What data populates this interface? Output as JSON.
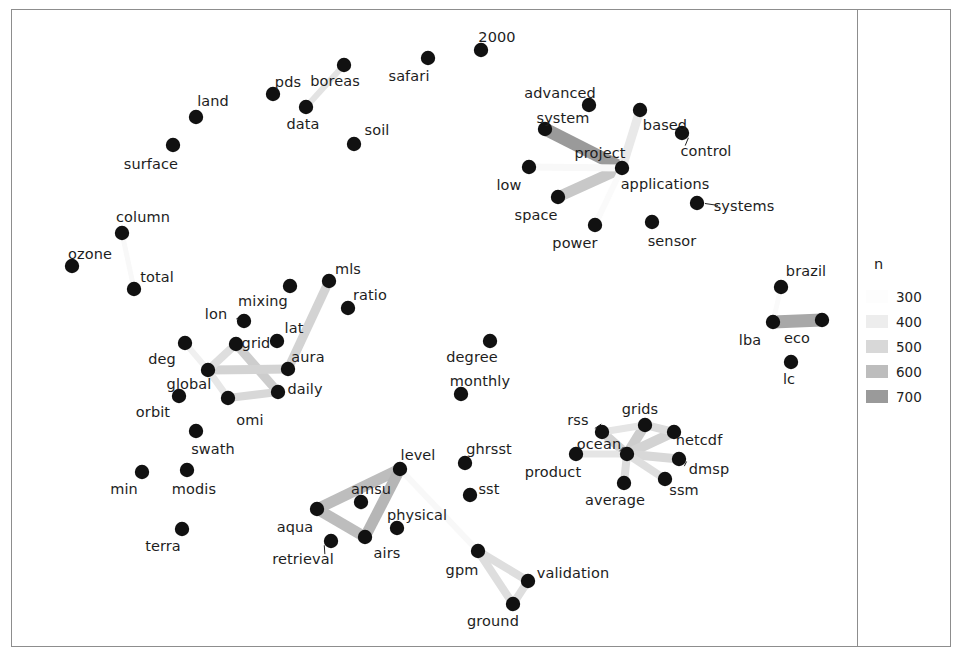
{
  "figure": {
    "title": "",
    "background": "#ffffff",
    "frame_color": "#8d8d8d",
    "node_color": "#111111",
    "label_color": "#1d1d1d"
  },
  "legend": {
    "title": "n",
    "position": "right",
    "entries": [
      {
        "value": "300",
        "color": "#fdfdfd"
      },
      {
        "value": "400",
        "color": "#ededed"
      },
      {
        "value": "500",
        "color": "#d8d8d8"
      },
      {
        "value": "600",
        "color": "#bdbdbd"
      },
      {
        "value": "700",
        "color": "#9a9a9a"
      }
    ]
  },
  "chart_data": {
    "type": "scatter",
    "subtype": "network-graph",
    "title": "",
    "xlabel": "",
    "ylabel": "",
    "grid": false,
    "legend_position": "right",
    "legend_title": "n",
    "legend_values": [
      300,
      400,
      500,
      600,
      700
    ],
    "edge_weight_range": [
      300,
      700
    ],
    "node_count": 56,
    "edge_count": 22,
    "nodes": [
      {
        "id": "2000",
        "label": "2000",
        "x": 481,
        "y": 50,
        "label_x": 497,
        "label_y": 37
      },
      {
        "id": "safari",
        "label": "safari",
        "x": 428,
        "y": 58,
        "label_x": 409,
        "label_y": 76
      },
      {
        "id": "pds",
        "label": "pds",
        "x": 273,
        "y": 94,
        "label_x": 288,
        "label_y": 82
      },
      {
        "id": "boreas",
        "label": "boreas",
        "x": 344,
        "y": 65,
        "label_x": 335,
        "label_y": 81
      },
      {
        "id": "data",
        "label": "data",
        "x": 306,
        "y": 107,
        "label_x": 303,
        "label_y": 124
      },
      {
        "id": "soil",
        "label": "soil",
        "x": 354,
        "y": 144,
        "label_x": 377,
        "label_y": 130
      },
      {
        "id": "land",
        "label": "land",
        "x": 196,
        "y": 117,
        "label_x": 213,
        "label_y": 101
      },
      {
        "id": "surface",
        "label": "surface",
        "x": 173,
        "y": 145,
        "label_x": 151,
        "label_y": 164
      },
      {
        "id": "advanced",
        "label": "advanced",
        "x": 589,
        "y": 105,
        "label_x": 560,
        "label_y": 93
      },
      {
        "id": "system",
        "label": "system",
        "x": 545,
        "y": 129,
        "label_x": 563,
        "label_y": 118
      },
      {
        "id": "based",
        "label": "based",
        "x": 640,
        "y": 110,
        "label_x": 665,
        "label_y": 125
      },
      {
        "id": "control",
        "label": "control",
        "x": 682,
        "y": 133,
        "label_x": 706,
        "label_y": 151
      },
      {
        "id": "project",
        "label": "project",
        "x": 622,
        "y": 168,
        "label_x": 600,
        "label_y": 153
      },
      {
        "id": "applications",
        "label": "applications",
        "x": 622,
        "y": 168,
        "label_x": 665,
        "label_y": 184
      },
      {
        "id": "low",
        "label": "low",
        "x": 529,
        "y": 167,
        "label_x": 509,
        "label_y": 185
      },
      {
        "id": "space",
        "label": "space",
        "x": 558,
        "y": 197,
        "label_x": 536,
        "label_y": 215
      },
      {
        "id": "systems",
        "label": "systems",
        "x": 697,
        "y": 203,
        "label_x": 744,
        "label_y": 206
      },
      {
        "id": "power",
        "label": "power",
        "x": 595,
        "y": 225,
        "label_x": 575,
        "label_y": 243
      },
      {
        "id": "sensor",
        "label": "sensor",
        "x": 652,
        "y": 222,
        "label_x": 672,
        "label_y": 241
      },
      {
        "id": "column",
        "label": "column",
        "x": 122,
        "y": 233,
        "label_x": 143,
        "label_y": 217
      },
      {
        "id": "ozone",
        "label": "ozone",
        "x": 72,
        "y": 266,
        "label_x": 90,
        "label_y": 254
      },
      {
        "id": "total",
        "label": "total",
        "x": 134,
        "y": 289,
        "label_x": 157,
        "label_y": 277
      },
      {
        "id": "mls",
        "label": "mls",
        "x": 329,
        "y": 281,
        "label_x": 348,
        "label_y": 269
      },
      {
        "id": "ratio",
        "label": "ratio",
        "x": 348,
        "y": 308,
        "label_x": 370,
        "label_y": 295
      },
      {
        "id": "mixing",
        "label": "mixing",
        "x": 290,
        "y": 286,
        "label_x": 263,
        "label_y": 301
      },
      {
        "id": "lon",
        "label": "lon",
        "x": 244,
        "y": 321,
        "label_x": 216,
        "label_y": 314
      },
      {
        "id": "grid",
        "label": "grid",
        "x": 236,
        "y": 344,
        "label_x": 256,
        "label_y": 343
      },
      {
        "id": "lat",
        "label": "lat",
        "x": 277,
        "y": 341,
        "label_x": 294,
        "label_y": 328
      },
      {
        "id": "deg",
        "label": "deg",
        "x": 185,
        "y": 343,
        "label_x": 162,
        "label_y": 359
      },
      {
        "id": "aura",
        "label": "aura",
        "x": 288,
        "y": 369,
        "label_x": 308,
        "label_y": 357
      },
      {
        "id": "global",
        "label": "global",
        "x": 208,
        "y": 370,
        "label_x": 189,
        "label_y": 384
      },
      {
        "id": "daily",
        "label": "daily",
        "x": 278,
        "y": 392,
        "label_x": 305,
        "label_y": 389
      },
      {
        "id": "orbit",
        "label": "orbit",
        "x": 179,
        "y": 396,
        "label_x": 153,
        "label_y": 412
      },
      {
        "id": "omi",
        "label": "omi",
        "x": 228,
        "y": 398,
        "label_x": 250,
        "label_y": 420
      },
      {
        "id": "swath",
        "label": "swath",
        "x": 196,
        "y": 431,
        "label_x": 213,
        "label_y": 449
      },
      {
        "id": "min",
        "label": "min",
        "x": 142,
        "y": 472,
        "label_x": 124,
        "label_y": 489
      },
      {
        "id": "modis",
        "label": "modis",
        "x": 187,
        "y": 470,
        "label_x": 194,
        "label_y": 489
      },
      {
        "id": "terra",
        "label": "terra",
        "x": 182,
        "y": 529,
        "label_x": 163,
        "label_y": 546
      },
      {
        "id": "degree",
        "label": "degree",
        "x": 490,
        "y": 341,
        "label_x": 472,
        "label_y": 357
      },
      {
        "id": "monthly",
        "label": "monthly",
        "x": 461,
        "y": 394,
        "label_x": 480,
        "label_y": 381
      },
      {
        "id": "aqua",
        "label": "aqua",
        "x": 317,
        "y": 509,
        "label_x": 295,
        "label_y": 527
      },
      {
        "id": "amsu",
        "label": "amsu",
        "x": 361,
        "y": 502,
        "label_x": 371,
        "label_y": 489
      },
      {
        "id": "level",
        "label": "level",
        "x": 400,
        "y": 469,
        "label_x": 418,
        "label_y": 455
      },
      {
        "id": "airs",
        "label": "airs",
        "x": 365,
        "y": 537,
        "label_x": 387,
        "label_y": 553
      },
      {
        "id": "retrieval",
        "label": "retrieval",
        "x": 331,
        "y": 541,
        "label_x": 303,
        "label_y": 559
      },
      {
        "id": "physical",
        "label": "physical",
        "x": 397,
        "y": 528,
        "label_x": 417,
        "label_y": 515
      },
      {
        "id": "ghrsst",
        "label": "ghrsst",
        "x": 465,
        "y": 463,
        "label_x": 489,
        "label_y": 449
      },
      {
        "id": "sst",
        "label": "sst",
        "x": 470,
        "y": 495,
        "label_x": 489,
        "label_y": 489
      },
      {
        "id": "gpm",
        "label": "gpm",
        "x": 478,
        "y": 551,
        "label_x": 462,
        "label_y": 570
      },
      {
        "id": "ground",
        "label": "ground",
        "x": 513,
        "y": 604,
        "label_x": 493,
        "label_y": 621
      },
      {
        "id": "validation",
        "label": "validation",
        "x": 528,
        "y": 581,
        "label_x": 573,
        "label_y": 573
      },
      {
        "id": "rss",
        "label": "rss",
        "x": 602,
        "y": 432,
        "label_x": 578,
        "label_y": 420
      },
      {
        "id": "grids",
        "label": "grids",
        "x": 645,
        "y": 425,
        "label_x": 640,
        "label_y": 409
      },
      {
        "id": "ocean",
        "label": "ocean",
        "x": 627,
        "y": 454,
        "label_x": 599,
        "label_y": 444
      },
      {
        "id": "product",
        "label": "product",
        "x": 576,
        "y": 454,
        "label_x": 553,
        "label_y": 472
      },
      {
        "id": "netcdf",
        "label": "netcdf",
        "x": 674,
        "y": 432,
        "label_x": 699,
        "label_y": 440
      },
      {
        "id": "dmsp",
        "label": "dmsp",
        "x": 679,
        "y": 459,
        "label_x": 709,
        "label_y": 469
      },
      {
        "id": "ssm",
        "label": "ssm",
        "x": 665,
        "y": 479,
        "label_x": 684,
        "label_y": 490
      },
      {
        "id": "average",
        "label": "average",
        "x": 624,
        "y": 483,
        "label_x": 615,
        "label_y": 500
      },
      {
        "id": "brazil",
        "label": "brazil",
        "x": 781,
        "y": 287,
        "label_x": 806,
        "label_y": 271
      },
      {
        "id": "lba",
        "label": "lba",
        "x": 773,
        "y": 322,
        "label_x": 750,
        "label_y": 340
      },
      {
        "id": "eco",
        "label": "eco",
        "x": 822,
        "y": 320,
        "label_x": 797,
        "label_y": 338
      },
      {
        "id": "lc",
        "label": "lc",
        "x": 791,
        "y": 362,
        "label_x": 789,
        "label_y": 379
      }
    ],
    "edges": [
      {
        "source": "boreas",
        "target": "data",
        "n": 450,
        "width": 6
      },
      {
        "source": "column",
        "target": "total",
        "n": 330,
        "width": 5
      },
      {
        "source": "system",
        "target": "project",
        "n": 700,
        "width": 13
      },
      {
        "source": "space",
        "target": "project",
        "n": 560,
        "width": 11
      },
      {
        "source": "based",
        "target": "project",
        "n": 420,
        "width": 9
      },
      {
        "source": "low",
        "target": "project",
        "n": 330,
        "width": 7
      },
      {
        "source": "power",
        "target": "project",
        "n": 320,
        "width": 6
      },
      {
        "source": "mls",
        "target": "aura",
        "n": 520,
        "width": 9
      },
      {
        "source": "grid",
        "target": "daily",
        "n": 540,
        "width": 9
      },
      {
        "source": "global",
        "target": "aura",
        "n": 520,
        "width": 9
      },
      {
        "source": "global",
        "target": "grid",
        "n": 470,
        "width": 8
      },
      {
        "source": "global",
        "target": "omi",
        "n": 430,
        "width": 7
      },
      {
        "source": "omi",
        "target": "daily",
        "n": 500,
        "width": 8
      },
      {
        "source": "deg",
        "target": "global",
        "n": 380,
        "width": 6
      },
      {
        "source": "aqua",
        "target": "level",
        "n": 600,
        "width": 11
      },
      {
        "source": "aqua",
        "target": "airs",
        "n": 600,
        "width": 11
      },
      {
        "source": "level",
        "target": "airs",
        "n": 620,
        "width": 11
      },
      {
        "source": "level",
        "target": "gpm",
        "n": 330,
        "width": 6
      },
      {
        "source": "gpm",
        "target": "validation",
        "n": 470,
        "width": 8
      },
      {
        "source": "gpm",
        "target": "ground",
        "n": 470,
        "width": 8
      },
      {
        "source": "ground",
        "target": "validation",
        "n": 470,
        "width": 8
      },
      {
        "source": "lba",
        "target": "eco",
        "n": 660,
        "width": 13
      },
      {
        "source": "brazil",
        "target": "lba",
        "n": 320,
        "width": 5
      },
      {
        "source": "rss",
        "target": "ocean",
        "n": 520,
        "width": 9
      },
      {
        "source": "ocean",
        "target": "grids",
        "n": 540,
        "width": 10
      },
      {
        "source": "ocean",
        "target": "netcdf",
        "n": 520,
        "width": 10
      },
      {
        "source": "ocean",
        "target": "dmsp",
        "n": 500,
        "width": 9
      },
      {
        "source": "ocean",
        "target": "ssm",
        "n": 470,
        "width": 8
      },
      {
        "source": "ocean",
        "target": "average",
        "n": 470,
        "width": 8
      },
      {
        "source": "ocean",
        "target": "product",
        "n": 440,
        "width": 7
      },
      {
        "source": "grids",
        "target": "netcdf",
        "n": 480,
        "width": 8
      },
      {
        "source": "rss",
        "target": "grids",
        "n": 440,
        "width": 7
      }
    ],
    "leader_lines": [
      {
        "from_label": "lon",
        "to_node": "lon"
      },
      {
        "from_label": "systems",
        "to_node": "systems"
      },
      {
        "from_label": "control",
        "to_node": "control"
      },
      {
        "from_label": "rss",
        "to_node": "rss"
      },
      {
        "from_label": "ocean",
        "to_node": "ocean"
      },
      {
        "from_label": "dmsp",
        "to_node": "dmsp"
      },
      {
        "from_label": "retrieval",
        "to_node": "retrieval"
      }
    ]
  }
}
